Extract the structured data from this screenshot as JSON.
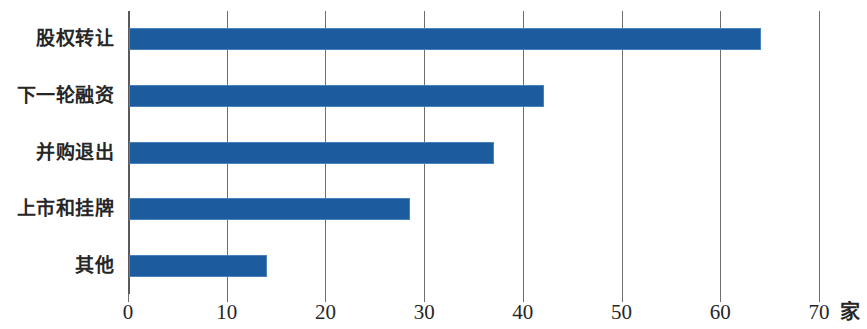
{
  "chart_data": {
    "type": "bar",
    "orientation": "horizontal",
    "title": "",
    "subtitle": "",
    "xlabel": "",
    "ylabel": "",
    "unit": "家",
    "categories": [
      "股权转让",
      "下一轮融资",
      "并购退出",
      "上市和挂牌",
      "其他"
    ],
    "values": [
      64,
      42,
      37,
      28.5,
      14
    ],
    "series": [
      {
        "name": "退出方式",
        "values": [
          64,
          42,
          37,
          28.5,
          14
        ]
      }
    ],
    "xlim": [
      0,
      70
    ],
    "ylim": null,
    "xticks": [
      0,
      10,
      20,
      30,
      40,
      50,
      60,
      70
    ],
    "xtick_labels": [
      "0",
      "10",
      "20",
      "30",
      "40",
      "50",
      "60",
      "70"
    ],
    "grid": "vertical",
    "legend": "none",
    "bar_color": "#1c5b9e",
    "bar_edge_color": "#4a82bd",
    "gridline_color": "#6e6e6e",
    "background_color": "#ffffff",
    "annotations": []
  }
}
